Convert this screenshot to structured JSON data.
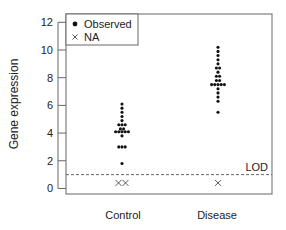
{
  "chart_data": {
    "type": "scatter",
    "subtype": "dot-strip-plot",
    "title": "",
    "xlabel": "",
    "ylabel": "Gene expression",
    "ylim": [
      -0.4,
      12.6
    ],
    "yticks": [
      0,
      2,
      4,
      6,
      8,
      10,
      12
    ],
    "categories": [
      "Control",
      "Disease"
    ],
    "grid": false,
    "legend": {
      "position": "top-left",
      "entries": [
        {
          "label": "Observed",
          "marker": "filled-circle"
        },
        {
          "label": "NA",
          "marker": "x"
        }
      ]
    },
    "reference_line": {
      "label": "LOD",
      "value": 1.0,
      "style": "dashed"
    },
    "series": [
      {
        "name": "Observed",
        "marker": "filled-circle",
        "groups": [
          {
            "category": "Control",
            "values": [
              6.1,
              5.8,
              5.5,
              5.2,
              4.9,
              4.6,
              4.6,
              4.6,
              4.3,
              4.3,
              4.1,
              4.1,
              4.1,
              4.1,
              4.1,
              3.8,
              3.0,
              3.0,
              3.0,
              1.8
            ]
          },
          {
            "category": "Disease",
            "values": [
              10.2,
              9.9,
              9.6,
              9.3,
              9.0,
              8.7,
              8.7,
              8.4,
              8.1,
              8.1,
              7.8,
              7.8,
              7.5,
              7.5,
              7.5,
              7.5,
              7.5,
              7.2,
              6.9,
              6.6,
              6.3,
              5.5
            ]
          }
        ]
      },
      {
        "name": "NA",
        "marker": "x",
        "groups": [
          {
            "category": "Control",
            "count": 2,
            "plotted_at": 0.4
          },
          {
            "category": "Disease",
            "count": 1,
            "plotted_at": 0.4
          }
        ]
      }
    ]
  },
  "labels": {
    "ylabel": "Gene expression",
    "lod": "LOD",
    "legend_observed": "Observed",
    "legend_na": "NA",
    "cat_control": "Control",
    "cat_disease": "Disease"
  },
  "colors": {
    "points": "#111111",
    "axis": "#555555",
    "text": "#222222"
  }
}
